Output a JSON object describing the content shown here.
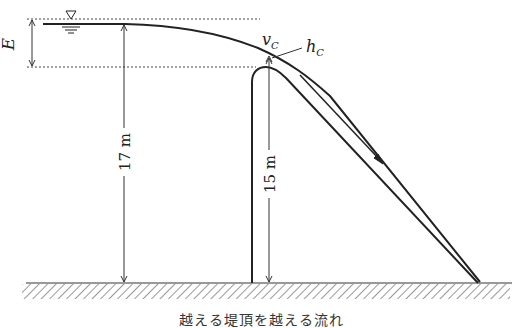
{
  "diagram": {
    "labels": {
      "energy_head": "E",
      "critical_velocity": "v",
      "critical_velocity_sub": "C",
      "critical_depth": "h",
      "critical_depth_sub": "C",
      "upstream_height": "17 m",
      "weir_height": "15 m"
    },
    "symbols": {
      "water_surface": "inverted-triangle water level mark"
    },
    "caption": "越える堤頂を越える流れ"
  }
}
